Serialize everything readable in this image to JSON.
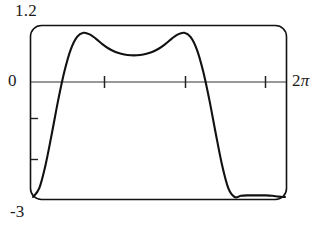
{
  "figure": {
    "kind": "graphing-calculator-plot",
    "labels": {
      "y_max": "1.2",
      "y_zero": "0",
      "y_min": "-3",
      "x_max_number": "2",
      "x_max_symbol": "π"
    },
    "style": {
      "curve_color": "#111111",
      "frame_color": "#111111",
      "axis_color": "#333333",
      "background": "#ffffff"
    }
  },
  "chart_data": {
    "type": "line",
    "title": "",
    "xlabel": "",
    "ylabel": "",
    "xlim": [
      0,
      6.283185
    ],
    "ylim": [
      -3,
      1.2
    ],
    "grid": false,
    "legend": "none",
    "x_tick_labels": [
      "0",
      "2π"
    ],
    "y_tick_labels": [
      "1.2",
      "0",
      "-3"
    ],
    "x_ticks_interior": [
      1.5708,
      3.14159,
      4.71239
    ],
    "y_ticks_interior": [
      -1,
      -2
    ],
    "axis_line_y": 0,
    "annotations": [
      {
        "text": "1.2",
        "position": "top-left-outside"
      },
      {
        "text": "0",
        "position": "left-of-axis"
      },
      {
        "text": "-3",
        "position": "bottom-left-outside"
      },
      {
        "text": "2π",
        "position": "right-of-frame"
      }
    ],
    "series": [
      {
        "name": "curve",
        "x": [
          0.0,
          0.15708,
          0.31416,
          0.47124,
          0.62832,
          0.7854,
          0.94248,
          1.09956,
          1.25664,
          1.41372,
          1.5708,
          1.72788,
          1.88496,
          2.04204,
          2.19911,
          2.35619,
          2.51327,
          2.67035,
          2.82743,
          2.98451,
          3.14159,
          3.29867,
          3.45575,
          3.61283,
          3.76991,
          3.92699,
          4.08407,
          4.24115,
          4.39823,
          4.55531,
          4.71239,
          4.86947,
          5.02655,
          5.18363,
          5.34071,
          5.49779,
          5.65487,
          5.81195,
          5.96903,
          6.12611,
          6.28319
        ],
        "y": [
          -3.0,
          -2.78,
          -2.2,
          -1.42,
          -0.6,
          0.12,
          0.66,
          0.97,
          1.07,
          1.03,
          0.92,
          0.79,
          0.68,
          0.6,
          0.55,
          0.52,
          0.51,
          0.52,
          0.55,
          0.6,
          0.68,
          0.79,
          0.92,
          1.03,
          1.07,
          0.97,
          0.66,
          0.12,
          -0.6,
          -1.42,
          -2.2,
          -2.78,
          -3.0,
          -2.97,
          -2.96,
          -2.96,
          -2.96,
          -2.96,
          -2.97,
          -2.99,
          -3.0
        ]
      }
    ],
    "features": {
      "left_peak": {
        "x_px": 88,
        "y_value": 1.07
      },
      "center_dip": {
        "x_px": 155,
        "y_value": 0.51
      },
      "right_peak": {
        "x_px": 218,
        "y_value": 1.07
      },
      "zero_crossings_px": [
        62,
        240
      ]
    }
  }
}
